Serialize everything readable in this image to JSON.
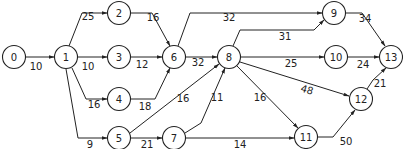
{
  "diagram": {
    "type": "activity-network",
    "nodes": [
      {
        "id": "0",
        "label": "0",
        "x": 14,
        "y": 57
      },
      {
        "id": "1",
        "label": "1",
        "x": 66,
        "y": 57
      },
      {
        "id": "2",
        "label": "2",
        "x": 119,
        "y": 13
      },
      {
        "id": "3",
        "label": "3",
        "x": 119,
        "y": 57
      },
      {
        "id": "4",
        "label": "4",
        "x": 119,
        "y": 99
      },
      {
        "id": "5",
        "label": "5",
        "x": 119,
        "y": 138
      },
      {
        "id": "6",
        "label": "6",
        "x": 174,
        "y": 57
      },
      {
        "id": "7",
        "label": "7",
        "x": 174,
        "y": 138
      },
      {
        "id": "8",
        "label": "8",
        "x": 229,
        "y": 57
      },
      {
        "id": "9",
        "label": "9",
        "x": 334,
        "y": 13
      },
      {
        "id": "10",
        "label": "10",
        "x": 336,
        "y": 57
      },
      {
        "id": "11",
        "label": "11",
        "x": 306,
        "y": 137
      },
      {
        "id": "12",
        "label": "12",
        "x": 361,
        "y": 99
      },
      {
        "id": "13",
        "label": "13",
        "x": 391,
        "y": 57
      }
    ],
    "edges": [
      {
        "from": "0",
        "to": "1",
        "weight": "10",
        "path": "M26,57 L54,57",
        "lx": 36,
        "ly": 70
      },
      {
        "from": "1",
        "to": "2",
        "weight": "25",
        "path": "M69,46 L82,13 L107,13",
        "lx": 88,
        "ly": 20
      },
      {
        "from": "1",
        "to": "3",
        "weight": "10",
        "path": "M78,57 L107,57",
        "lx": 88,
        "ly": 70
      },
      {
        "from": "1",
        "to": "4",
        "weight": "16",
        "path": "M72,68 L86,99 L107,99",
        "lx": 94,
        "ly": 108
      },
      {
        "from": "1",
        "to": "5",
        "weight": "9",
        "path": "M66,69 L78,138 L107,138",
        "lx": 90,
        "ly": 148
      },
      {
        "from": "2",
        "to": "6",
        "weight": "16",
        "path": "M131,13 L152,13 L170,46",
        "lx": 153,
        "ly": 21
      },
      {
        "from": "3",
        "to": "6",
        "weight": "12",
        "path": "M131,57 L162,57",
        "lx": 142,
        "ly": 68
      },
      {
        "from": "4",
        "to": "6",
        "weight": "18",
        "path": "M131,99 L155,99 L170,68",
        "lx": 145,
        "ly": 110
      },
      {
        "from": "6",
        "to": "9",
        "weight": "32",
        "path": "M178,46 L190,13 L322,13",
        "lx": 229,
        "ly": 21
      },
      {
        "from": "6",
        "to": "8",
        "weight": "32",
        "path": "M186,57 L217,57",
        "lx": 198,
        "ly": 66
      },
      {
        "from": "5",
        "to": "8",
        "weight": "16",
        "path": "M130,133 L219,64",
        "lx": 183,
        "ly": 102
      },
      {
        "from": "5",
        "to": "7",
        "weight": "21",
        "path": "M131,138 L162,138",
        "lx": 147,
        "ly": 148
      },
      {
        "from": "7",
        "to": "8",
        "weight": "11",
        "path": "M185,133 L201,123 L225,68",
        "lx": 217,
        "ly": 101
      },
      {
        "from": "7",
        "to": "11",
        "weight": "14",
        "path": "M186,138 L294,138",
        "lx": 240,
        "ly": 148
      },
      {
        "from": "8",
        "to": "9",
        "weight": "31",
        "path": "M233,46 L240,30 L314,30 L324,20",
        "lx": 285,
        "ly": 40
      },
      {
        "from": "8",
        "to": "10",
        "weight": "25",
        "path": "M241,57 L324,57",
        "lx": 291,
        "ly": 67
      },
      {
        "from": "8",
        "to": "12",
        "weight": "48",
        "path": "M240,62 L349,96",
        "lx": 306,
        "ly": 93
      },
      {
        "from": "8",
        "to": "11",
        "weight": "16",
        "path": "M237,66 L298,128",
        "lx": 260,
        "ly": 101
      },
      {
        "from": "10",
        "to": "13",
        "weight": "24",
        "path": "M348,57 L379,57",
        "lx": 363,
        "ly": 68
      },
      {
        "from": "9",
        "to": "13",
        "weight": "34",
        "path": "M346,13 L362,13 L385,46",
        "lx": 365,
        "ly": 22
      },
      {
        "from": "12",
        "to": "13",
        "weight": "21",
        "path": "M367,89 L373,80 L386,68",
        "lx": 380,
        "ly": 87
      },
      {
        "from": "11",
        "to": "12",
        "weight": "50",
        "path": "M318,137 L333,137 L355,110",
        "lx": 346,
        "ly": 145
      }
    ]
  }
}
